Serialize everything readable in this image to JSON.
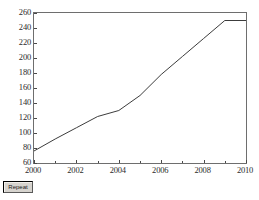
{
  "window": {
    "background_color": "#ffffff"
  },
  "controls": {
    "repeat_button_label": "Repeat"
  },
  "chart_data": {
    "type": "line",
    "title": "",
    "subtitle": "",
    "xlabel": "",
    "ylabel": "",
    "xlim": [
      2000,
      2010
    ],
    "ylim": [
      60,
      260
    ],
    "xticks": [
      2000,
      2002,
      2004,
      2006,
      2008,
      2010
    ],
    "xtick_labels": [
      "2000",
      "2002",
      "2004",
      "2006",
      "2008",
      "2010"
    ],
    "yticks": [
      60,
      80,
      100,
      120,
      140,
      160,
      180,
      200,
      220,
      240,
      260
    ],
    "ytick_labels": [
      "60",
      "80",
      "100",
      "120",
      "140",
      "160",
      "180",
      "200",
      "220",
      "240",
      "260"
    ],
    "grid": false,
    "legend": false,
    "legend_position": "none",
    "line_color": "#3c3c3c",
    "line_width": 1,
    "marker": "none",
    "x": [
      2000,
      2001,
      2002,
      2003,
      2004,
      2005,
      2006,
      2007,
      2008,
      2009,
      2010
    ],
    "values": [
      76,
      92,
      107,
      122,
      130,
      150,
      178,
      202,
      226,
      250,
      250
    ],
    "series": [
      {
        "name": "series-1",
        "x": [
          2000,
          2001,
          2002,
          2003,
          2004,
          2005,
          2006,
          2007,
          2008,
          2009,
          2010
        ],
        "values": [
          76,
          92,
          107,
          122,
          130,
          150,
          178,
          202,
          226,
          250,
          250
        ]
      }
    ],
    "annotations": []
  }
}
